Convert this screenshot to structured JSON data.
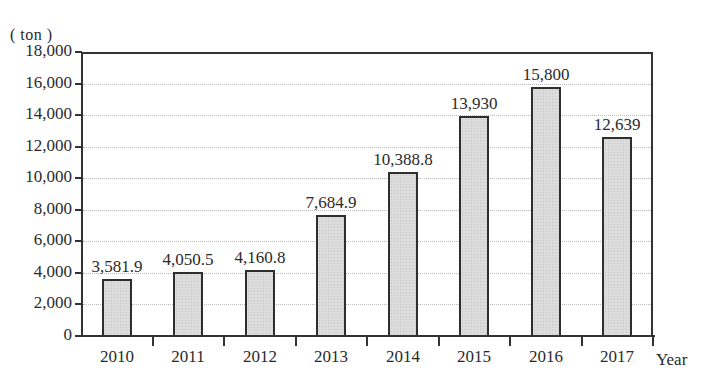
{
  "chart_data": {
    "type": "bar",
    "title": "",
    "unit_label": "( ton )",
    "xlabel": "Year",
    "ylabel": "ton",
    "ylim": [
      0,
      18000
    ],
    "yticks": [
      0,
      2000,
      4000,
      6000,
      8000,
      10000,
      12000,
      14000,
      16000,
      18000
    ],
    "ytick_labels": [
      "0",
      "2,000",
      "4,000",
      "6,000",
      "8,000",
      "10,000",
      "12,000",
      "14,000",
      "16,000",
      "18,000"
    ],
    "grid": true,
    "legend": null,
    "categories": [
      "2010",
      "2011",
      "2012",
      "2013",
      "2014",
      "2015",
      "2016",
      "2017"
    ],
    "values": [
      3581.9,
      4050.5,
      4160.8,
      7684.9,
      10388.8,
      13930,
      15800,
      12639
    ],
    "value_labels": [
      "3,581.9",
      "4,050.5",
      "4,160.8",
      "7,684.9",
      "10,388.8",
      "13,930",
      "15,800",
      "12,639"
    ],
    "bar_color": "#dcdcdc",
    "bar_edge_color": "#2e2e2e"
  }
}
